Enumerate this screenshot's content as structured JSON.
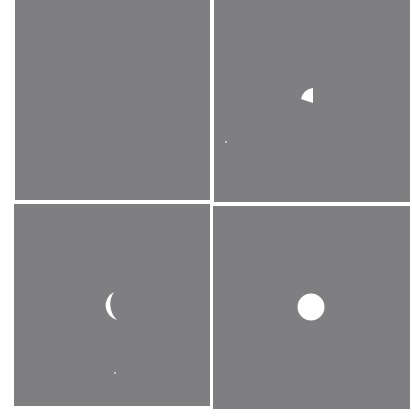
{
  "figure": {
    "background_color": "#7f7f81",
    "shape_color": "#ffffff",
    "layout": "2x2 grid",
    "panels": [
      {
        "position": "top-left",
        "content": "empty",
        "shapes": []
      },
      {
        "position": "top-right",
        "content": "small wedge (circle sector) with straight right edge",
        "shapes": [
          {
            "type": "wedge",
            "bbox_px": [
              300,
              88,
              313,
              103
            ]
          },
          {
            "type": "speck",
            "center_px": [
              226,
              142
            ]
          }
        ]
      },
      {
        "position": "bottom-left",
        "content": "crescent / half-moon",
        "shapes": [
          {
            "type": "crescent",
            "bbox_px": [
              99,
              292,
              117,
              320
            ]
          },
          {
            "type": "speck",
            "center_px": [
              115,
              373
            ]
          }
        ]
      },
      {
        "position": "bottom-right",
        "content": "full circle",
        "shapes": [
          {
            "type": "circle",
            "center_px": [
              311,
              307
            ],
            "radius_px": 13.5
          }
        ]
      }
    ]
  }
}
